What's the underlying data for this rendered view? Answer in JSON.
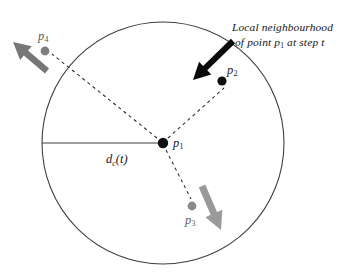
{
  "figure": {
    "name": "local-neighbourhood-diagram",
    "width": 362,
    "height": 275,
    "background": "#ffffff"
  },
  "caption": {
    "line1": "Local neighbourhood",
    "line2_pre": "of point p",
    "line2_sub": "1",
    "line2_post": " at step t"
  },
  "circle": {
    "label": "neighbourhood-circle",
    "cx": 163,
    "cy": 143,
    "r": 121,
    "stroke": "#3f3f3f",
    "stroke_width": 1.1,
    "fill": "none"
  },
  "radius_line": {
    "label": "d_c(t)",
    "text_pre": "d",
    "text_sub": "c",
    "text_post": "(t)",
    "x1": 42,
    "y1": 143,
    "x2": 163,
    "y2": 143,
    "stroke": "#3f3f3f",
    "stroke_width": 1.1,
    "label_x": 106,
    "label_y": 153
  },
  "points": [
    {
      "id": "p1",
      "label_pre": "p",
      "label_sub": "1",
      "x": 163,
      "y": 143,
      "radius": 5.2,
      "color": "#101010",
      "label_x": 173,
      "label_y": 137,
      "tone": "black"
    },
    {
      "id": "p2",
      "label_pre": "p",
      "label_sub": "2",
      "x": 222,
      "y": 81,
      "radius": 4.6,
      "color": "#101010",
      "label_x": 227,
      "label_y": 64,
      "tone": "black"
    },
    {
      "id": "p3",
      "label_pre": "p",
      "label_sub": "3",
      "x": 192,
      "y": 206,
      "radius": 4.4,
      "color": "#8a8a8a",
      "label_x": 185,
      "label_y": 214,
      "tone": "gray"
    },
    {
      "id": "p4",
      "label_pre": "p",
      "label_sub": "4",
      "x": 45,
      "y": 51,
      "radius": 4.4,
      "color": "#7d7d7d",
      "label_x": 38,
      "label_y": 30,
      "tone": "gray"
    }
  ],
  "dashed_links": [
    {
      "id": "link-p1-p2",
      "from": "p1",
      "to": "p2",
      "x1": 168,
      "y1": 138,
      "x2": 224,
      "y2": 88
    },
    {
      "id": "link-p1-p3",
      "from": "p1",
      "to": "p3",
      "x1": 166,
      "y1": 150,
      "x2": 191,
      "y2": 199
    },
    {
      "id": "link-p1-p4",
      "from": "p1",
      "to": "p4",
      "x1": 157,
      "y1": 138,
      "x2": 52,
      "y2": 54
    }
  ],
  "velocity_arrows": [
    {
      "id": "arrow-p2",
      "for_point": "p2",
      "color": "#0a0a0a",
      "x1": 233,
      "y1": 41,
      "x2": 193,
      "y2": 80,
      "shaft_width": 6.0,
      "head_length": 17,
      "head_width": 17.5
    },
    {
      "id": "arrow-p3",
      "for_point": "p3",
      "color": "#9a9a9a",
      "x1": 202,
      "y1": 186,
      "x2": 221,
      "y2": 230,
      "shaft_width": 7.0,
      "head_length": 18,
      "head_width": 18.5
    },
    {
      "id": "arrow-p4",
      "for_point": "p4",
      "color": "#777777",
      "x1": 47,
      "y1": 71,
      "x2": 13,
      "y2": 42,
      "shaft_width": 6.4,
      "head_length": 17,
      "head_width": 18
    }
  ],
  "style": {
    "dash_pattern": "3.2 3.4",
    "dash_color": "#2b2b2b",
    "dash_width": 1.05
  }
}
